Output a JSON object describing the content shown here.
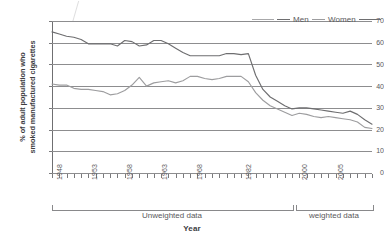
{
  "chart_data": {
    "type": "line",
    "title": "",
    "xlabel": "Year",
    "ylabel": "% of adult population who smoked manufactured cigarettes",
    "ylabel_line1": "% of adult population who",
    "ylabel_line2": "smoked manufactured cigarettes",
    "ylim": [
      0,
      70
    ],
    "ytick_labels": [
      "70",
      "60",
      "50",
      "40",
      "30",
      "20",
      "10",
      "0"
    ],
    "ytick_values": [
      70,
      60,
      50,
      40,
      30,
      20,
      10,
      0
    ],
    "grid": true,
    "grid_axis": "y",
    "legend_position": "top-right",
    "x": [
      1948,
      1949,
      1950,
      1951,
      1952,
      1953,
      1954,
      1955,
      1956,
      1957,
      1958,
      1959,
      1960,
      1961,
      1962,
      1963,
      1964,
      1965,
      1966,
      1967,
      1968,
      1969,
      1970,
      1972,
      1974,
      1976,
      1978,
      1980,
      1982,
      1984,
      1986,
      1988,
      1990,
      1992,
      1994,
      1996,
      1998,
      2000,
      2001,
      2002,
      2003,
      2004,
      2005,
      2006,
      2007
    ],
    "xtick_labels": [
      "1948",
      "1953",
      "1958",
      "1963",
      "1968",
      "1982",
      "2000",
      "2005"
    ],
    "series": [
      {
        "name": "Men",
        "color": "#6e6e70",
        "values": [
          65,
          64,
          63,
          62.5,
          61.5,
          59.5,
          59.5,
          59.5,
          59.5,
          58.5,
          61,
          60.5,
          58.5,
          59,
          61,
          61,
          59.5,
          57.5,
          55.5,
          54,
          54,
          54,
          54,
          54,
          55,
          55,
          54.5,
          55,
          45,
          38.5,
          35,
          33,
          31,
          29.5,
          30,
          30,
          29.5,
          29,
          28.5,
          28,
          27.5,
          28.5,
          27,
          24.5,
          22.5
        ]
      },
      {
        "name": "Women",
        "color": "#9d9d9f",
        "values": [
          41,
          40.5,
          40.5,
          39,
          38.5,
          38.5,
          38,
          37.5,
          36,
          36.5,
          38,
          40.5,
          44,
          40,
          41.5,
          42,
          42.5,
          41.5,
          42.5,
          44.5,
          44.5,
          43.5,
          43,
          43.5,
          44.5,
          44.5,
          44.5,
          42,
          37,
          33.5,
          31,
          29.5,
          28,
          26.5,
          27.5,
          27,
          26,
          25.5,
          26,
          25.5,
          25,
          24.5,
          23.5,
          21,
          20.5
        ]
      }
    ],
    "annotations": [
      {
        "label": "Unweighted data",
        "span": "1948-2000"
      },
      {
        "label": "weighted data",
        "span": "2000-2007"
      }
    ]
  },
  "legend": {
    "items": [
      {
        "label": "Men",
        "color": "#6e6e70"
      },
      {
        "label": "Women",
        "color": "#9d9d9f"
      }
    ]
  },
  "axis": {
    "x_title": "Year"
  }
}
